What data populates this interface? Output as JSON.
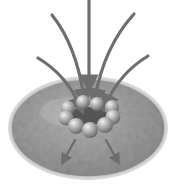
{
  "figure": {
    "colors": {
      "background": "#ffffff",
      "disc_fill": "#9a9a9a",
      "disc_rim": "#d6d6d6",
      "disc_edge": "#7a7a7a",
      "arrow": "#6e6e6e",
      "sphere_light": "#e2e2e2",
      "sphere_dark": "#7c7c7c",
      "pore_center": "#5a5a5a"
    },
    "incoming_arrows": 5,
    "ring_spheres": 10,
    "outgoing_arrows": 2
  }
}
